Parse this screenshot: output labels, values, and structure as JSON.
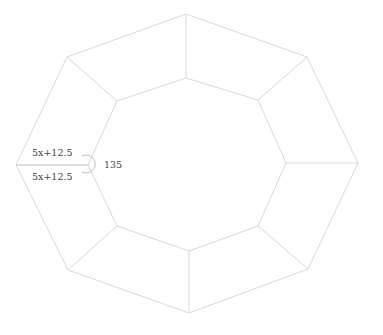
{
  "diagram": {
    "type": "octagonal-frame",
    "colors": {
      "edge": "#d9d9d9",
      "highlight": "#bdbdbd",
      "text": "#444444"
    },
    "outer_vertices": [
      [
        186,
        14
      ],
      [
        307,
        57
      ],
      [
        358,
        163
      ],
      [
        308,
        269
      ],
      [
        189,
        313
      ],
      [
        68,
        270
      ],
      [
        16,
        165
      ],
      [
        67,
        57
      ]
    ],
    "inner_vertices": [
      [
        186,
        78
      ],
      [
        258,
        100
      ],
      [
        286,
        163
      ],
      [
        258,
        226
      ],
      [
        189,
        251
      ],
      [
        117,
        226
      ],
      [
        88,
        165
      ],
      [
        117,
        101
      ]
    ],
    "labels": {
      "top_segment": "5x+12.5",
      "bottom_segment": "5x+12.5",
      "angle": "135"
    }
  }
}
